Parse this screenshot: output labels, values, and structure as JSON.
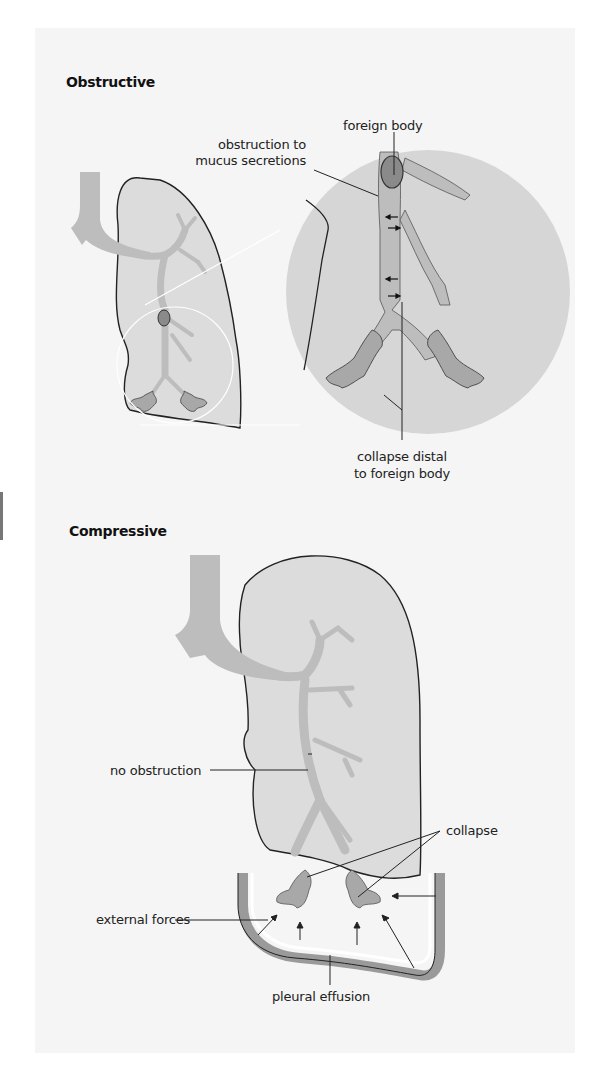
{
  "figure": {
    "sections": [
      {
        "title": "Obstructive",
        "labels": {
          "foreign_body": "foreign body",
          "obstruction_line1": "obstruction to",
          "obstruction_line2": "mucus secretions",
          "collapse_distal_line1": "collapse distal",
          "collapse_distal_line2": "to foreign body"
        }
      },
      {
        "title": "Compressive",
        "labels": {
          "no_obstruction": "no obstruction",
          "collapse": "collapse",
          "external_forces": "external forces",
          "pleural_effusion": "pleural effusion"
        }
      }
    ],
    "colors": {
      "page_bg": "#f5f5f5",
      "lung_fill": "#dcdcdc",
      "airway_fill": "#bdbdbd",
      "foreign_body_fill": "#8a8a8a",
      "outline": "#222222",
      "zoom_circle_fill": "#d6d6d6"
    }
  }
}
